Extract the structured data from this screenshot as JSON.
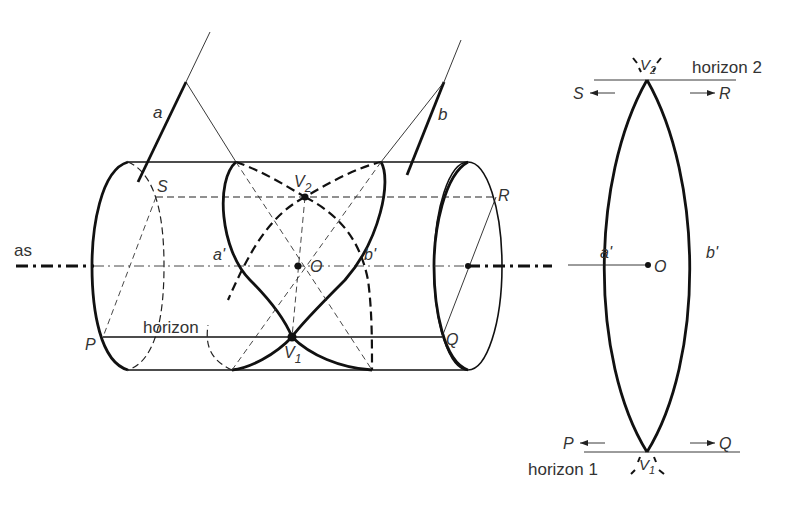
{
  "figure": {
    "left_view": {
      "axis_label": "as",
      "ray_a_label": "a",
      "ray_b_label": "b",
      "point_S": "S",
      "point_R": "R",
      "point_P": "P",
      "point_Q": "Q",
      "vertex_top": "V",
      "vertex_top_sub": "2",
      "vertex_bottom": "V",
      "vertex_bottom_sub": "1",
      "center": "O",
      "curve_a": "a'",
      "curve_b": "b'",
      "horizon": "horizon"
    },
    "right_view": {
      "horizon_top": "horizon 2",
      "horizon_bottom": "horizon 1",
      "vertex_top": "V",
      "vertex_top_sub": "2",
      "vertex_bottom": "V",
      "vertex_bottom_sub": "1",
      "arrow_S": "S",
      "arrow_R": "R",
      "arrow_P": "P",
      "arrow_Q": "Q",
      "curve_a": "a'",
      "curve_b": "b'",
      "center": "O"
    },
    "colors": {
      "line": "#111111",
      "text": "#333333",
      "background": "#ffffff"
    }
  }
}
